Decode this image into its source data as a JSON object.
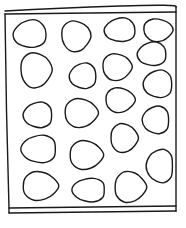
{
  "diagram": {
    "stroke_color": "#1a1a1a",
    "background_color": "#ffffff",
    "frame": {
      "top_outer": [
        [
          5,
          11
        ],
        [
          60,
          8
        ],
        [
          120,
          6
        ],
        [
          176,
          7
        ]
      ],
      "top_inner": [
        [
          5,
          14
        ],
        [
          176,
          12
        ]
      ],
      "left": [
        [
          5,
          14
        ],
        [
          7,
          120
        ],
        [
          9,
          208
        ]
      ],
      "right": [
        [
          176,
          7
        ],
        [
          176,
          110
        ],
        [
          176,
          208
        ]
      ],
      "bottom_inner": [
        [
          9,
          208
        ],
        [
          176,
          206
        ]
      ],
      "bottom_outer": [
        [
          9,
          213
        ],
        [
          176,
          211
        ]
      ]
    },
    "shapes": [
      {
        "cx": 30,
        "cy": 34,
        "rx": 16,
        "ry": 14
      },
      {
        "cx": 76,
        "cy": 36,
        "rx": 15,
        "ry": 15
      },
      {
        "cx": 120,
        "cy": 30,
        "rx": 15,
        "ry": 12
      },
      {
        "cx": 158,
        "cy": 30,
        "rx": 15,
        "ry": 11
      },
      {
        "cx": 152,
        "cy": 54,
        "rx": 14,
        "ry": 12
      },
      {
        "cx": 36,
        "cy": 70,
        "rx": 16,
        "ry": 17
      },
      {
        "cx": 83,
        "cy": 76,
        "rx": 13,
        "ry": 13
      },
      {
        "cx": 117,
        "cy": 67,
        "rx": 15,
        "ry": 13
      },
      {
        "cx": 158,
        "cy": 84,
        "rx": 14,
        "ry": 14
      },
      {
        "cx": 120,
        "cy": 100,
        "rx": 15,
        "ry": 12
      },
      {
        "cx": 38,
        "cy": 115,
        "rx": 14,
        "ry": 13
      },
      {
        "cx": 81,
        "cy": 113,
        "rx": 17,
        "ry": 14
      },
      {
        "cx": 156,
        "cy": 120,
        "rx": 13,
        "ry": 14
      },
      {
        "cx": 124,
        "cy": 138,
        "rx": 14,
        "ry": 14
      },
      {
        "cx": 39,
        "cy": 149,
        "rx": 17,
        "ry": 14
      },
      {
        "cx": 86,
        "cy": 155,
        "rx": 17,
        "ry": 14
      },
      {
        "cx": 160,
        "cy": 166,
        "rx": 13,
        "ry": 17
      },
      {
        "cx": 40,
        "cy": 186,
        "rx": 18,
        "ry": 14
      },
      {
        "cx": 89,
        "cy": 190,
        "rx": 16,
        "ry": 12
      },
      {
        "cx": 130,
        "cy": 187,
        "rx": 16,
        "ry": 15
      }
    ],
    "shape_count": 20
  }
}
